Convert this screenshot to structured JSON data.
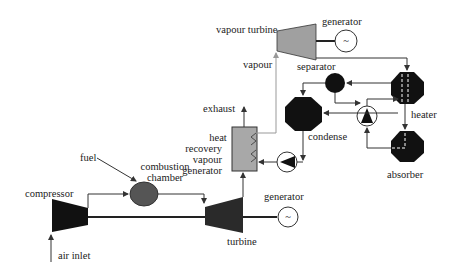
{
  "diagram": {
    "labels": {
      "compressor": "compressor",
      "air_inlet": "air inlet",
      "fuel": "fuel",
      "combustion_chamber_1": "combustion",
      "combustion_chamber_2": "chamber",
      "turbine": "turbine",
      "generator_gas": "generator",
      "exhaust": "exhaust",
      "hrvg_1": "heat",
      "hrvg_2": "recovery",
      "hrvg_3": "vapour",
      "hrvg_4": "generator",
      "vapour": "vapour",
      "vapour_turbine": "vapour turbine",
      "generator_vapour": "generator",
      "separator": "separator",
      "condense": "condense",
      "heater": "heater",
      "absorber": "absorber"
    },
    "generator_symbol": "~",
    "colors": {
      "black_component": "#111111",
      "grey_turbine": "#a0a0a0",
      "dark_turbine": "#2a2a2a",
      "combustion": "#555555",
      "hrvg_fill": "#a8a8a8",
      "line": "#333333"
    }
  }
}
